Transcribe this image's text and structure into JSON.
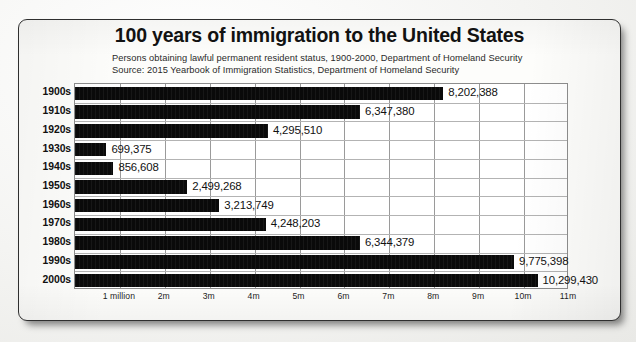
{
  "title": "100 years of immigration to the United States",
  "subtitle1": "Persons obtaining lawful permanent resident status, 1900-2000, Department of Homeland Security",
  "subtitle2": "Source: 2015 Yearbook of Immigration Statistics, Department of Homeland Security",
  "chart_data": {
    "type": "bar",
    "orientation": "horizontal",
    "title": "100 years of immigration to the United States",
    "subtitle": "Persons obtaining lawful permanent resident status, 1900-2000, Department of Homeland Security",
    "source": "Source: 2015 Yearbook of Immigration Statistics, Department of Homeland Security",
    "xlabel": "",
    "ylabel": "",
    "categories": [
      "1900s",
      "1910s",
      "1920s",
      "1930s",
      "1940s",
      "1950s",
      "1960s",
      "1970s",
      "1980s",
      "1990s",
      "2000s"
    ],
    "values": [
      8202388,
      6347380,
      4295510,
      699375,
      856608,
      2499268,
      3213749,
      4248203,
      6344379,
      9775398,
      10299430
    ],
    "value_labels": [
      "8,202,388",
      "6,347,380",
      "4,295,510",
      "699,375",
      "856,608",
      "2,499,268",
      "3,213,749",
      "4,248,203",
      "6,344,379",
      "9,775,398",
      "10,299,430"
    ],
    "xlim": [
      0,
      11000000
    ],
    "xticks": [
      1000000,
      2000000,
      3000000,
      4000000,
      5000000,
      6000000,
      7000000,
      8000000,
      9000000,
      10000000,
      11000000
    ],
    "xtick_labels": [
      "1 million",
      "2m",
      "3m",
      "4m",
      "5m",
      "6m",
      "7m",
      "8m",
      "9m",
      "10m",
      "11m"
    ],
    "grid": true,
    "legend": false,
    "bar_color": "#0a0a0a",
    "grid_color": "#9a9a9a",
    "background": "#ffffff"
  }
}
